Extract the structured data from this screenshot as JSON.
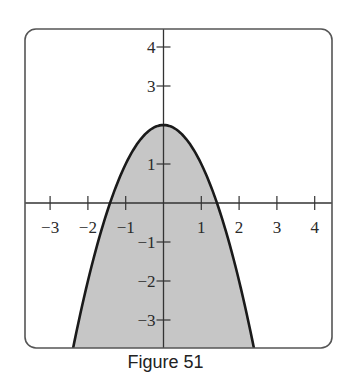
{
  "caption": "Figure 51",
  "colors": {
    "fill": "#c6c6c6",
    "curve": "#1a1a1a",
    "axis": "#333333",
    "frame": "#555555"
  },
  "chart_data": {
    "type": "area",
    "title": "",
    "caption": "Figure 51",
    "function": "y = 2 - x^2",
    "region": "shaded region below the parabola y = 2 - x^2",
    "x": [
      -2.4,
      -2,
      -1.5,
      -1.414,
      -1,
      -0.5,
      0,
      0.5,
      1,
      1.414,
      1.5,
      2,
      2.4
    ],
    "y": [
      -3.76,
      -2,
      -0.25,
      0,
      1,
      1.75,
      2,
      1.75,
      1,
      0,
      -0.25,
      -2,
      -3.76
    ],
    "vertex": [
      0,
      2
    ],
    "x_intercepts": [
      -1.414,
      1.414
    ],
    "xlim": [
      -3.7,
      4.5
    ],
    "ylim": [
      -3.7,
      4.6
    ],
    "x_ticks": [
      "-3",
      "-2",
      "-1",
      "1",
      "2",
      "3",
      "4"
    ],
    "y_ticks": [
      "4",
      "3",
      "1",
      "-1",
      "-2",
      "-3"
    ],
    "xlabel": "",
    "ylabel": "",
    "grid": false,
    "legend": null
  },
  "x_ticks": [
    {
      "label": "−3",
      "v": -3
    },
    {
      "label": "−2",
      "v": -2
    },
    {
      "label": "−1",
      "v": -1
    },
    {
      "label": "1",
      "v": 1
    },
    {
      "label": "2",
      "v": 2
    },
    {
      "label": "3",
      "v": 3
    },
    {
      "label": "4",
      "v": 4
    }
  ],
  "y_ticks": [
    {
      "label": "4",
      "v": 4
    },
    {
      "label": "3",
      "v": 3
    },
    {
      "label": "1",
      "v": 1
    },
    {
      "label": "−1",
      "v": -1
    },
    {
      "label": "−2",
      "v": -2
    },
    {
      "label": "−3",
      "v": -3
    }
  ]
}
